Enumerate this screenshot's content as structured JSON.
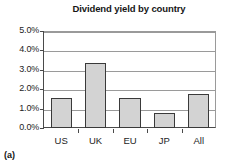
{
  "caption": "(a)",
  "chart_data": {
    "type": "bar",
    "title": "Dividend yield by country",
    "xlabel": "",
    "ylabel": "",
    "categories": [
      "US",
      "UK",
      "EU",
      "JP",
      "All"
    ],
    "values": [
      1.57,
      3.35,
      1.55,
      0.77,
      1.75
    ],
    "value_labels": [
      "1.57%",
      "3.35%",
      "1.55%",
      "0.77%",
      "1.75%"
    ],
    "ylim": [
      0.0,
      5.0
    ],
    "ytick_values": [
      0.0,
      1.0,
      2.0,
      3.0,
      4.0,
      5.0
    ],
    "ytick_labels": [
      "0.0%",
      "1.0%",
      "2.0%",
      "3.0%",
      "4.0%",
      "5.0%"
    ],
    "grid": true,
    "grid_axis": "y",
    "legend": false,
    "legend_position": "none",
    "series": [
      {
        "name": "Dividend yield",
        "values": [
          1.57,
          3.35,
          1.55,
          0.77,
          1.75
        ]
      }
    ],
    "colors": {
      "bar_fill": "#d3d3d3",
      "bar_border": "#3a3a3a",
      "gridline": "#9a9a9a",
      "axis": "#4a4a4a",
      "text": "#1d1d1d",
      "background": "#ffffff"
    }
  }
}
